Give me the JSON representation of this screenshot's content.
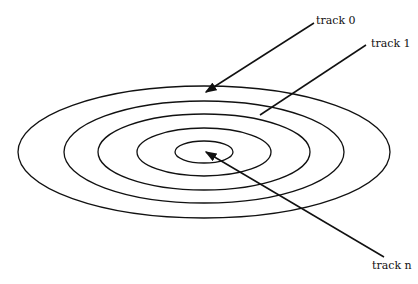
{
  "diagram": {
    "type": "concentric-tracks",
    "labels": {
      "track0": "track 0",
      "track1": "track 1",
      "trackn": "track n"
    },
    "ellipses": [
      {
        "rx": 186,
        "ry": 66
      },
      {
        "rx": 140,
        "ry": 51
      },
      {
        "rx": 106,
        "ry": 38
      },
      {
        "rx": 67,
        "ry": 24
      },
      {
        "rx": 29,
        "ry": 11
      }
    ]
  }
}
